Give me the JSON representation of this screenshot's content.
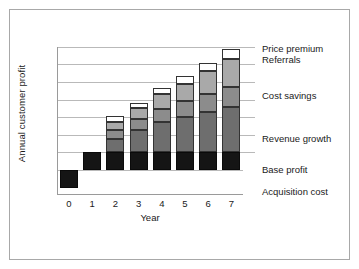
{
  "chart_data": {
    "type": "bar",
    "title": "",
    "subtitle": "",
    "xlabel": "Year",
    "ylabel": "Annual customer profit",
    "stacked": true,
    "grid": true,
    "legend_position": "right-callouts",
    "categories": [
      "0",
      "1",
      "2",
      "3",
      "4",
      "5",
      "6",
      "7"
    ],
    "ylim": [
      -1,
      7
    ],
    "yticks": [],
    "series": [
      {
        "name": "Acquisition cost",
        "color": "#151515",
        "values": [
          -1.0,
          0,
          0,
          0,
          0,
          0,
          0,
          0
        ]
      },
      {
        "name": "Base profit",
        "color": "#151515",
        "values": [
          0,
          1.0,
          1.0,
          1.0,
          1.0,
          1.0,
          1.0,
          1.0
        ]
      },
      {
        "name": "Revenue growth",
        "color": "#6e6e6e",
        "values": [
          0,
          0,
          0.75,
          1.3,
          1.7,
          2.0,
          2.3,
          2.6
        ]
      },
      {
        "name": "Cost savings",
        "color": "#8c8c8c",
        "values": [
          0,
          0,
          0.5,
          0.6,
          0.75,
          0.9,
          1.0,
          1.1
        ]
      },
      {
        "name": "Referrals",
        "color": "#a9a9a9",
        "values": [
          0,
          0,
          0.5,
          0.6,
          0.85,
          1.0,
          1.3,
          1.6
        ]
      },
      {
        "name": "Price premium",
        "color": "#ffffff",
        "values": [
          0,
          0,
          0.3,
          0.3,
          0.35,
          0.45,
          0.5,
          0.55
        ]
      }
    ],
    "totals_above_zero": [
      0,
      1.0,
      3.05,
      3.8,
      4.65,
      5.35,
      6.1,
      6.85
    ],
    "annotations": [
      "Price premium",
      "Referrals",
      "Cost savings",
      "Revenue growth",
      "Base profit",
      "Acquisition cost"
    ]
  },
  "axes": {
    "y_title": "Annual customer profit",
    "x_title": "Year",
    "x_ticks": [
      "0",
      "1",
      "2",
      "3",
      "4",
      "5",
      "6",
      "7"
    ]
  },
  "callouts": [
    {
      "label": "Price premium"
    },
    {
      "label": "Referrals"
    },
    {
      "label": "Cost savings"
    },
    {
      "label": "Revenue growth"
    },
    {
      "label": "Base profit"
    },
    {
      "label": "Acquisition cost"
    }
  ],
  "colors": {
    "frame": "#a8a8a8",
    "gridline": "#b9b9b9",
    "axis": "#9a9a9a",
    "base_profit": "#151515",
    "acquisition_cost": "#151515",
    "revenue_growth": "#6e6e6e",
    "cost_savings": "#8c8c8c",
    "referrals": "#a9a9a9",
    "price_premium": "#ffffff",
    "text": "#1a1a1a",
    "background": "#ffffff"
  }
}
